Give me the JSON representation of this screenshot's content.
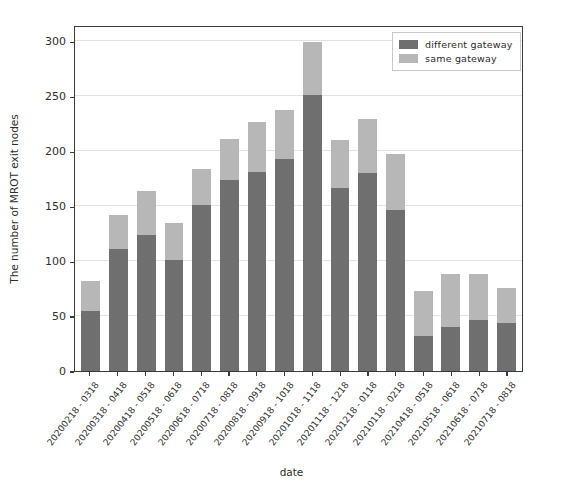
{
  "chart_data": {
    "type": "bar",
    "subtype": "stacked-vertical",
    "title": "",
    "xlabel": "date",
    "ylabel": "The number of MROT exit nodes",
    "ylim": [
      0,
      315
    ],
    "yticks": [
      0,
      50,
      100,
      150,
      200,
      250,
      300
    ],
    "ytick_labels": [
      "0",
      "50",
      "100",
      "150",
      "200",
      "250",
      "300"
    ],
    "grid": true,
    "grid_axis": "y",
    "legend_position": "upper right",
    "categories": [
      "20200218 - 0318",
      "20200318 - 0418",
      "20200418 - 0518",
      "20200518 - 0618",
      "20200618 - 0718",
      "20200718 - 0818",
      "20200818 - 0918",
      "20200918 - 1018",
      "20201018 - 1118",
      "20201118 - 1218",
      "20201218 - 0118",
      "20210118 - 0218",
      "20210418 - 0518",
      "20210518 - 0618",
      "20210618 - 0718",
      "20210718 - 0818"
    ],
    "series": [
      {
        "name": "different gateway",
        "color": "#6f6f6f",
        "values": [
          55,
          111,
          124,
          101,
          151,
          174,
          181,
          193,
          251,
          167,
          180,
          147,
          32,
          40,
          46,
          44
        ]
      },
      {
        "name": "same gateway",
        "color": "#b7b7b7",
        "values": [
          27,
          31,
          40,
          34,
          33,
          37,
          46,
          45,
          49,
          43,
          49,
          51,
          41,
          48,
          42,
          32
        ]
      }
    ],
    "totals": [
      82,
      142,
      164,
      135,
      184,
      211,
      227,
      238,
      300,
      210,
      229,
      198,
      73,
      88,
      88,
      76
    ]
  },
  "legend": {
    "items": [
      {
        "label": "different gateway",
        "swatch_name": "legend-swatch-different-gateway"
      },
      {
        "label": "same gateway",
        "swatch_name": "legend-swatch-same-gateway"
      }
    ]
  },
  "axes": {
    "x_title": "date",
    "y_title": "The number of MROT exit nodes"
  },
  "colors": {
    "different_gateway": "#6f6f6f",
    "same_gateway": "#b7b7b7",
    "axis": "#3b3b3b",
    "grid": "#e2e2e2",
    "background": "#ffffff"
  }
}
